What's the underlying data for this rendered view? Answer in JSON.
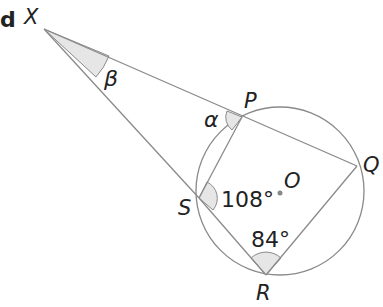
{
  "part_label": "d",
  "points": {
    "X": {
      "label": "X",
      "x": 44,
      "y": 29
    },
    "P": {
      "label": "P",
      "x": 242,
      "y": 117
    },
    "Q": {
      "label": "Q",
      "x": 357,
      "y": 166
    },
    "R": {
      "label": "R",
      "x": 266,
      "y": 275
    },
    "S": {
      "label": "S",
      "x": 199,
      "y": 198
    },
    "O": {
      "label": "O",
      "x": 280,
      "y": 193
    }
  },
  "circle": {
    "cx": 280,
    "cy": 191,
    "r": 84
  },
  "angles": {
    "beta": {
      "label": "β",
      "at": "X"
    },
    "alpha": {
      "label": "α",
      "at": "P"
    },
    "angle_S": {
      "label": "108°",
      "at": "S"
    },
    "angle_R": {
      "label": "84°",
      "at": "R"
    }
  },
  "colors": {
    "line": "#8a8a8a",
    "shade": "#e4e4e4",
    "text": "#222222"
  }
}
